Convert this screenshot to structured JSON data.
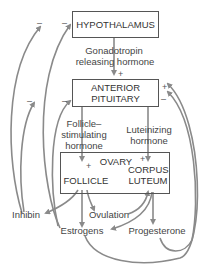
{
  "boxes": {
    "hypothalamus": "HYPOTHALAMUS",
    "anterior_pituitary_1": "ANTERIOR",
    "anterior_pituitary_2": "PITUITARY",
    "ovary": "OVARY",
    "follicle": "FOLLICLE",
    "corpus_luteum_1": "CORPUS",
    "corpus_luteum_2": "LUTEUM"
  },
  "labels": {
    "gnrh_1": "Gonadotropin",
    "gnrh_2": "releasing hormone",
    "fsh_1": "Follicle–",
    "fsh_2": "stimulating",
    "fsh_3": "hormone",
    "lh_1": "Luteinizing",
    "lh_2": "hormone",
    "inhibin": "Inhibin",
    "ovulation": "Ovulation",
    "estrogens": "Estrogens",
    "progesterone": "Progesterone"
  },
  "signs": {
    "plus": "+",
    "minus": "–"
  },
  "colors": {
    "arrow": "#8a8a8a",
    "box_border": "#555555",
    "text": "#333333"
  }
}
